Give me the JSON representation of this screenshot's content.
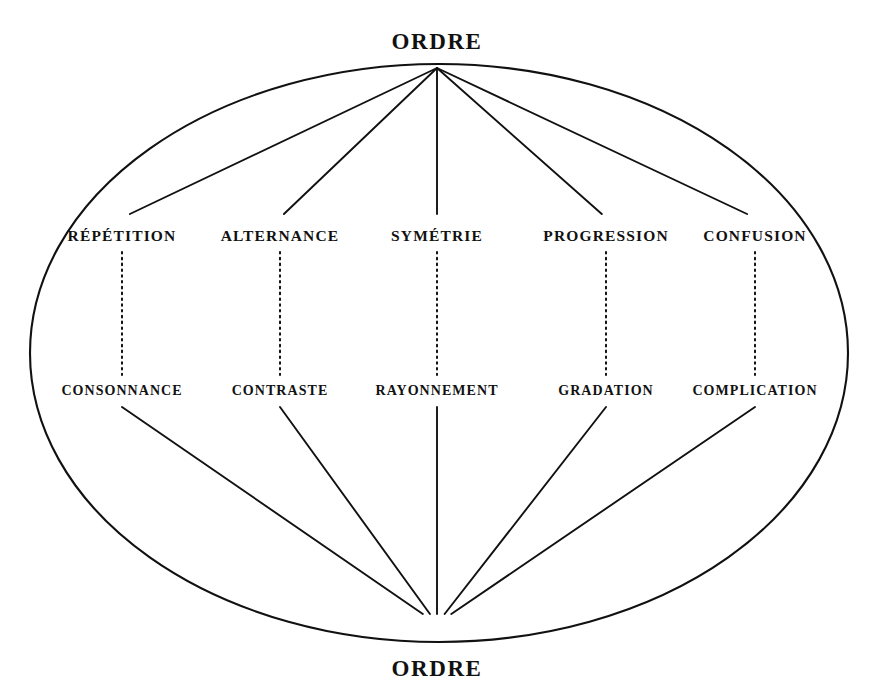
{
  "figure": {
    "title_top": "ORDRE",
    "title_bottom": "ORDRE",
    "ink_color": "#111111",
    "background_color": "#ffffff",
    "upper_tier": [
      {
        "label": "RÉPÉTITION",
        "x": 122,
        "y": 236
      },
      {
        "label": "ALTERNANCE",
        "x": 280,
        "y": 236
      },
      {
        "label": "SYMÉTRIE",
        "x": 437,
        "y": 236
      },
      {
        "label": "PROGRESSION",
        "x": 606,
        "y": 236
      },
      {
        "label": "CONFUSION",
        "x": 755,
        "y": 236
      }
    ],
    "lower_tier": [
      {
        "label": "CONSONNANCE",
        "x": 122,
        "y": 391
      },
      {
        "label": "CONTRASTE",
        "x": 280,
        "y": 391
      },
      {
        "label": "RAYONNEMENT",
        "x": 437,
        "y": 391
      },
      {
        "label": "GRADATION",
        "x": 606,
        "y": 391
      },
      {
        "label": "COMPLICATION",
        "x": 755,
        "y": 391
      }
    ],
    "ellipse": {
      "cx": 439,
      "cy": 353,
      "rx": 409,
      "ry": 289
    },
    "top_apex": {
      "x": 437,
      "y": 65
    },
    "bottom_convergence": {
      "x": 437,
      "y": 618
    },
    "top_label_pos": {
      "x": 437,
      "y": 41
    },
    "bottom_label_pos": {
      "x": 437,
      "y": 668
    }
  }
}
